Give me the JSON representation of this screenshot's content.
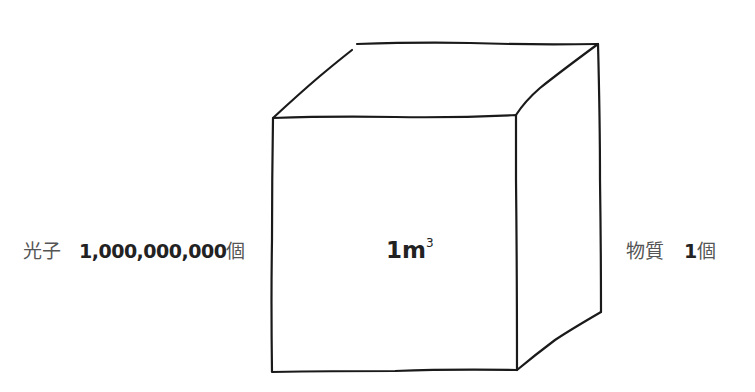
{
  "diagram": {
    "cube": {
      "center_label": {
        "value": "1m",
        "exponent": "3"
      },
      "corners": {
        "front_top_left": [
          273,
          118
        ],
        "front_top_right": [
          516,
          115
        ],
        "front_bottom_left": [
          272,
          372
        ],
        "front_bottom_right": [
          517,
          370
        ],
        "back_top_left": [
          357,
          44
        ],
        "back_top_right": [
          598,
          44
        ],
        "back_bottom_right": [
          601,
          312
        ]
      },
      "stroke_color": "#1a1a1a"
    },
    "left_annotation": {
      "name": "光子",
      "count": "1,000,000,000",
      "unit": "個"
    },
    "right_annotation": {
      "name": "物質",
      "count": "1",
      "unit": "個"
    }
  }
}
